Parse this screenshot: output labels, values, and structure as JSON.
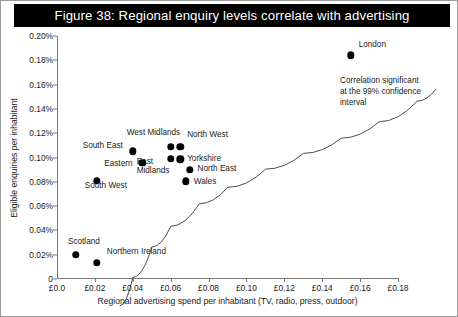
{
  "figure": {
    "title": "Figure 38: Regional enquiry levels correlate with advertising"
  },
  "annotation": {
    "line1": "Correlation significant",
    "line2": "at the 99% confidence",
    "line3": "interval"
  },
  "chart_data": {
    "type": "scatter",
    "title": "Figure 38: Regional enquiry levels correlate with advertising",
    "xlabel": "Regional advertising spend per inhabitant (TV, radio, press, outdoor)",
    "ylabel": "Eligible enquiries per inhabitant",
    "xlim": [
      0,
      0.18
    ],
    "ylim": [
      0,
      0.002
    ],
    "grid": false,
    "legend": "none",
    "x_ticklabels": [
      "£0.0",
      "£0.02",
      "£0.04",
      "£0.06",
      "£0.08",
      "£0.10",
      "£0.12",
      "£0.14",
      "£0.16",
      "£0.18"
    ],
    "x_tickvalues": [
      0,
      0.02,
      0.04,
      0.06,
      0.08,
      0.1,
      0.12,
      0.14,
      0.16,
      0.18
    ],
    "y_ticklabels": [
      "0",
      "0.02%",
      "0.04%",
      "0.06%",
      "0.08%",
      "0.10%",
      "0.12%",
      "0.14%",
      "0.16%",
      "0.18%",
      "0.20%"
    ],
    "y_tickvalues": [
      0,
      0.0002,
      0.0004,
      0.0006,
      0.0008,
      0.001,
      0.0012,
      0.0014,
      0.0016,
      0.0018,
      0.002
    ],
    "points": [
      {
        "name": "Scotland",
        "x": 0.01,
        "y": 0.0002,
        "label_dx": -8,
        "label_dy": -13,
        "align": "left"
      },
      {
        "name": "Northern Ireland",
        "x": 0.021,
        "y": 0.000135,
        "label_dx": 10,
        "label_dy": -11,
        "align": "left"
      },
      {
        "name": "South West",
        "x": 0.021,
        "y": 0.00081,
        "label_dx": -12,
        "label_dy": 5,
        "align": "left",
        "wrap": true
      },
      {
        "name": "South East",
        "x": 0.04,
        "y": 0.00105,
        "label_dx": -50,
        "label_dy": -5,
        "align": "left"
      },
      {
        "name": "Eastern",
        "x": 0.045,
        "y": 0.000955,
        "label_dx": -38,
        "label_dy": 1,
        "align": "left"
      },
      {
        "name": "West Midlands",
        "x": 0.06,
        "y": 0.00109,
        "label_dx": -44,
        "label_dy": -14,
        "align": "left"
      },
      {
        "name": "North West",
        "x": 0.065,
        "y": 0.00109,
        "label_dx": 7,
        "label_dy": -12,
        "align": "left"
      },
      {
        "name": "East Midlands",
        "x": 0.06,
        "y": 0.00099,
        "label_dx": -34,
        "label_dy": 3,
        "align": "left",
        "wrap": true
      },
      {
        "name": "Yorkshire",
        "x": 0.065,
        "y": 0.000985,
        "label_dx": 7,
        "label_dy": 0,
        "align": "left"
      },
      {
        "name": "North East",
        "x": 0.07,
        "y": 0.0009,
        "label_dx": 8,
        "label_dy": -1,
        "align": "left"
      },
      {
        "name": "Wales",
        "x": 0.068,
        "y": 0.000805,
        "label_dx": 8,
        "label_dy": 1,
        "align": "left"
      },
      {
        "name": "London",
        "x": 0.155,
        "y": 0.00184,
        "label_dx": 8,
        "label_dy": -10,
        "align": "left"
      }
    ],
    "trendline": {
      "description": "logarithmic best-fit curve rising from lower-left to upper-right",
      "points": [
        {
          "x": 0.003,
          "y": 7.5e-05
        },
        {
          "x": 0.01,
          "y": 0.00031
        },
        {
          "x": 0.02,
          "y": 0.00056
        },
        {
          "x": 0.03,
          "y": 0.00073
        },
        {
          "x": 0.045,
          "y": 0.000915
        },
        {
          "x": 0.06,
          "y": 0.00105
        },
        {
          "x": 0.08,
          "y": 0.0012
        },
        {
          "x": 0.1,
          "y": 0.00133
        },
        {
          "x": 0.12,
          "y": 0.001455
        },
        {
          "x": 0.14,
          "y": 0.00159
        },
        {
          "x": 0.16,
          "y": 0.00176
        },
        {
          "x": 0.17,
          "y": 0.00186
        }
      ]
    }
  }
}
